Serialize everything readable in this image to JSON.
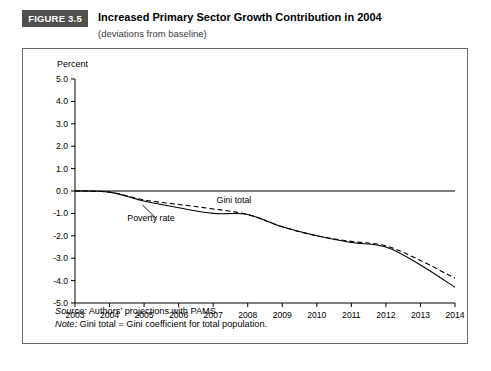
{
  "figure": {
    "badge": "FIGURE 3.5",
    "title": "Increased Primary Sector Growth Contribution in 2004",
    "subtitle": "(deviations from baseline)",
    "axis_unit_label": "Percent",
    "source_label": "Source:",
    "source_text": " Authors’ projections with PAMS.",
    "note_label": "Note:",
    "note_text": " Gini total = Gini coefficient for total population."
  },
  "chart_data": {
    "type": "line",
    "title": "Increased Primary Sector Growth Contribution in 2004",
    "subtitle": "(deviations from baseline)",
    "xlabel": "",
    "ylabel": "Percent",
    "xlim": [
      2003,
      2014
    ],
    "ylim": [
      -5.0,
      5.0
    ],
    "grid": false,
    "legend_position": "inline-annotations",
    "x_ticks": [
      "2003",
      "2004",
      "2005",
      "2006",
      "2007",
      "2008",
      "2009",
      "2010",
      "2011",
      "2012",
      "2013",
      "2014"
    ],
    "y_ticks": [
      "5.0",
      "4.0",
      "3.0",
      "2.0",
      "1.0",
      "0.0",
      "-1.0",
      "-2.0",
      "-3.0",
      "-4.0",
      "-5.0"
    ],
    "x": [
      2003,
      2004,
      2005,
      2006,
      2007,
      2008,
      2009,
      2010,
      2011,
      2012,
      2013,
      2014
    ],
    "series": [
      {
        "name": "Poverty rate",
        "style": "solid",
        "values": [
          0.0,
          -0.05,
          -0.45,
          -0.75,
          -1.0,
          -1.05,
          -1.6,
          -2.0,
          -2.3,
          -2.5,
          -3.3,
          -4.3
        ]
      },
      {
        "name": "Gini total",
        "style": "dashed",
        "values": [
          0.0,
          -0.05,
          -0.4,
          -0.6,
          -0.8,
          -1.05,
          -1.6,
          -2.0,
          -2.25,
          -2.45,
          -3.1,
          -3.9
        ]
      }
    ],
    "annotations": [
      {
        "text": "Gini total",
        "x": 2007.6,
        "y": -0.55
      },
      {
        "text": "Poverty rate",
        "x": 2005.2,
        "y": -1.35
      }
    ]
  }
}
